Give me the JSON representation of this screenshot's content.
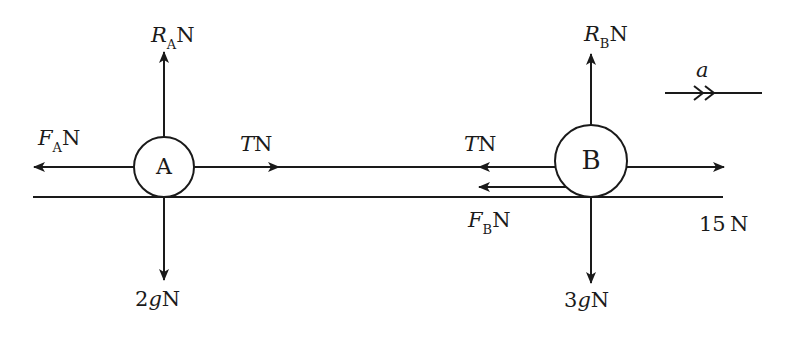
{
  "diagram": {
    "type": "free-body diagram",
    "stroke_color": "#1a1a1a",
    "background": "#ffffff",
    "particles": [
      {
        "id": "A",
        "label": "A",
        "cx": 164,
        "cy": 167,
        "r": 30
      },
      {
        "id": "B",
        "label": "B",
        "cx": 591,
        "cy": 161,
        "r": 36
      }
    ],
    "surface": {
      "x1": 33,
      "x2": 723,
      "y": 197
    },
    "forces": {
      "RA": {
        "symbol": "R",
        "subscript": "A",
        "unit": "N",
        "direction": "up"
      },
      "FA": {
        "symbol": "F",
        "subscript": "A",
        "unit": "N",
        "direction": "left"
      },
      "TA": {
        "symbol": "T",
        "unit": "N",
        "direction": "right"
      },
      "WA": {
        "value": "2",
        "symbol": "g",
        "unit": "N",
        "direction": "down"
      },
      "RB": {
        "symbol": "R",
        "subscript": "B",
        "unit": "N",
        "direction": "up"
      },
      "TB": {
        "symbol": "T",
        "unit": "N",
        "direction": "left"
      },
      "FB": {
        "symbol": "F",
        "subscript": "B",
        "unit": "N",
        "direction": "left"
      },
      "P": {
        "value": "15",
        "unit": "N",
        "direction": "right"
      },
      "WB": {
        "value": "3",
        "symbol": "g",
        "unit": "N",
        "direction": "down"
      }
    },
    "acceleration": {
      "symbol": "a",
      "direction": "right"
    }
  }
}
